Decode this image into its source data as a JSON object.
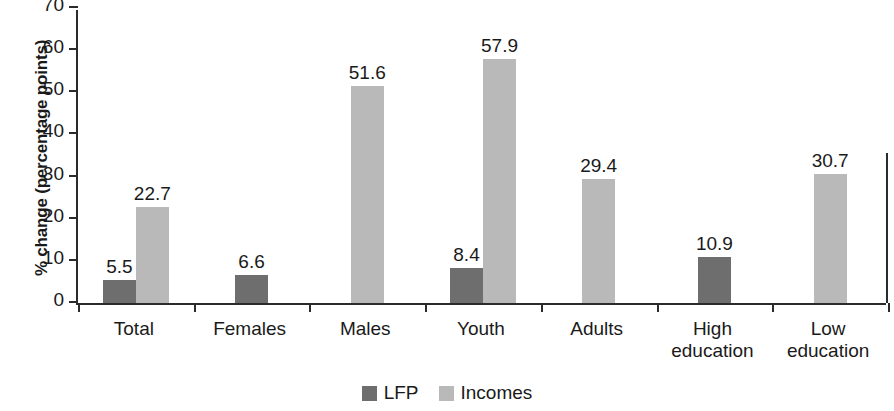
{
  "chart_data": {
    "type": "bar",
    "title": "",
    "xlabel": "",
    "ylabel": "% change (percentage points)",
    "ylim": [
      0,
      70
    ],
    "ytick_step": 10,
    "yticks": [
      "70",
      "60",
      "50",
      "40",
      "30",
      "20",
      "10",
      "0"
    ],
    "grid": false,
    "legend_position": "bottom-center",
    "categories": [
      "Total",
      "Females",
      "Males",
      "Youth",
      "Adults",
      "High education",
      "Low education"
    ],
    "category_lines": [
      [
        "Total"
      ],
      [
        "Females"
      ],
      [
        "Males"
      ],
      [
        "Youth"
      ],
      [
        "Adults"
      ],
      [
        "High",
        "education"
      ],
      [
        "Low",
        "education"
      ]
    ],
    "series": [
      {
        "name": "LFP",
        "color": "#6e6e6e",
        "values": [
          5.5,
          6.6,
          null,
          8.4,
          null,
          10.9,
          null
        ],
        "labels": [
          "5.5",
          "6.6",
          "",
          "8.4",
          "",
          "10.9",
          ""
        ]
      },
      {
        "name": "Incomes",
        "color": "#b9b9b9",
        "values": [
          22.7,
          null,
          51.6,
          57.9,
          29.4,
          null,
          30.7
        ],
        "labels": [
          "22.7",
          "",
          "51.6",
          "57.9",
          "29.4",
          "",
          "30.7"
        ]
      }
    ]
  },
  "legend": {
    "items": [
      {
        "label": "LFP",
        "color": "#6e6e6e"
      },
      {
        "label": "Incomes",
        "color": "#b9b9b9"
      }
    ]
  },
  "axis": {
    "y_title": "% change (percentage points)"
  }
}
